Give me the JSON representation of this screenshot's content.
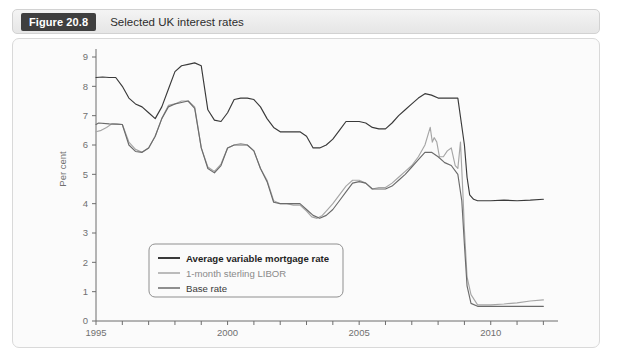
{
  "figure": {
    "badge": "Figure 20.8",
    "caption": "Selected UK interest rates"
  },
  "chart_data": {
    "type": "line",
    "title": "Selected UK interest rates",
    "xlabel": "",
    "ylabel": "Per cent",
    "xlim": [
      1995,
      2012.1
    ],
    "ylim": [
      0,
      9
    ],
    "yticks": [
      0,
      1,
      2,
      3,
      4,
      5,
      6,
      7,
      8,
      9
    ],
    "xticks": [
      1995,
      1996,
      1997,
      1998,
      1999,
      2000,
      2001,
      2002,
      2003,
      2004,
      2005,
      2006,
      2007,
      2008,
      2009,
      2010,
      2011,
      2012
    ],
    "xtick_labels_shown": [
      "1995",
      "2000",
      "2005",
      "2010"
    ],
    "grid": false,
    "legend_position": "lower-left-inside",
    "series": [
      {
        "name": "Average variable mortgage rate",
        "color": "#3a3a3a",
        "width": 1.15,
        "x": [
          1995.0,
          1995.25,
          1995.5,
          1995.75,
          1996.0,
          1996.25,
          1996.5,
          1996.75,
          1997.0,
          1997.25,
          1997.5,
          1997.75,
          1998.0,
          1998.25,
          1998.5,
          1998.75,
          1999.0,
          1999.25,
          1999.5,
          1999.75,
          2000.0,
          2000.25,
          2000.5,
          2000.75,
          2001.0,
          2001.25,
          2001.5,
          2001.75,
          2002.0,
          2002.25,
          2002.5,
          2002.75,
          2003.0,
          2003.25,
          2003.5,
          2003.75,
          2004.0,
          2004.25,
          2004.5,
          2004.75,
          2005.0,
          2005.25,
          2005.5,
          2005.75,
          2006.0,
          2006.25,
          2006.5,
          2006.75,
          2007.0,
          2007.25,
          2007.5,
          2007.75,
          2008.0,
          2008.25,
          2008.5,
          2008.75,
          2009.0,
          2009.1,
          2009.2,
          2009.35,
          2009.5,
          2010.0,
          2010.5,
          2011.0,
          2011.5,
          2012.0
        ],
        "y": [
          8.3,
          8.32,
          8.3,
          8.3,
          8.0,
          7.6,
          7.4,
          7.3,
          7.1,
          6.9,
          7.3,
          7.9,
          8.5,
          8.7,
          8.75,
          8.8,
          8.7,
          7.2,
          6.85,
          6.8,
          7.1,
          7.55,
          7.6,
          7.6,
          7.55,
          7.3,
          6.9,
          6.6,
          6.45,
          6.45,
          6.45,
          6.45,
          6.3,
          5.9,
          5.9,
          6.0,
          6.2,
          6.5,
          6.8,
          6.8,
          6.8,
          6.75,
          6.6,
          6.55,
          6.55,
          6.75,
          7.0,
          7.2,
          7.4,
          7.6,
          7.75,
          7.7,
          7.6,
          7.6,
          7.6,
          7.6,
          6.0,
          4.9,
          4.3,
          4.15,
          4.1,
          4.1,
          4.12,
          4.1,
          4.12,
          4.15
        ]
      },
      {
        "name": "1-month sterling LIBOR",
        "color": "#a6a6a6",
        "width": 1.15,
        "x": [
          1995.0,
          1995.2,
          1995.4,
          1995.6,
          1995.8,
          1996.0,
          1996.25,
          1996.5,
          1996.75,
          1997.0,
          1997.25,
          1997.5,
          1997.75,
          1998.0,
          1998.25,
          1998.5,
          1998.75,
          1999.0,
          1999.25,
          1999.5,
          1999.75,
          2000.0,
          2000.25,
          2000.5,
          2000.75,
          2001.0,
          2001.25,
          2001.5,
          2001.75,
          2002.0,
          2002.25,
          2002.5,
          2002.75,
          2003.0,
          2003.2,
          2003.4,
          2003.6,
          2003.8,
          2004.0,
          2004.25,
          2004.5,
          2004.75,
          2005.0,
          2005.25,
          2005.5,
          2005.75,
          2006.0,
          2006.25,
          2006.5,
          2006.75,
          2007.0,
          2007.25,
          2007.5,
          2007.7,
          2007.78,
          2007.85,
          2007.95,
          2008.05,
          2008.2,
          2008.35,
          2008.5,
          2008.65,
          2008.75,
          2008.85,
          2008.95,
          2009.0,
          2009.1,
          2009.25,
          2009.5,
          2010.0,
          2010.5,
          2011.0,
          2011.5,
          2012.0
        ],
        "y": [
          6.45,
          6.5,
          6.6,
          6.72,
          6.72,
          6.7,
          6.1,
          5.85,
          5.75,
          5.9,
          6.3,
          6.9,
          7.35,
          7.4,
          7.5,
          7.5,
          7.3,
          5.9,
          5.25,
          5.1,
          5.35,
          5.9,
          6.0,
          6.05,
          6.0,
          5.8,
          5.2,
          4.8,
          4.1,
          4.0,
          4.0,
          3.95,
          3.95,
          3.75,
          3.55,
          3.5,
          3.6,
          3.8,
          4.0,
          4.3,
          4.6,
          4.8,
          4.8,
          4.7,
          4.5,
          4.55,
          4.55,
          4.7,
          4.9,
          5.1,
          5.3,
          5.6,
          6.0,
          6.6,
          6.1,
          6.25,
          6.1,
          5.6,
          5.6,
          5.8,
          5.9,
          5.3,
          5.2,
          6.1,
          4.2,
          3.1,
          1.5,
          0.9,
          0.55,
          0.55,
          0.58,
          0.62,
          0.68,
          0.72
        ]
      },
      {
        "name": "Base rate",
        "color": "#6b6b6b",
        "width": 1.15,
        "x": [
          1995.0,
          1995.1,
          1995.5,
          1996.0,
          1996.25,
          1996.5,
          1996.75,
          1997.0,
          1997.25,
          1997.5,
          1997.75,
          1998.0,
          1998.25,
          1998.5,
          1998.75,
          1999.0,
          1999.25,
          1999.5,
          1999.75,
          2000.0,
          2000.25,
          2000.5,
          2000.75,
          2001.0,
          2001.25,
          2001.5,
          2001.75,
          2002.0,
          2002.5,
          2002.75,
          2003.0,
          2003.25,
          2003.5,
          2003.75,
          2004.0,
          2004.25,
          2004.5,
          2004.75,
          2005.0,
          2005.25,
          2005.5,
          2005.75,
          2006.0,
          2006.25,
          2006.5,
          2006.75,
          2007.0,
          2007.25,
          2007.5,
          2007.75,
          2008.0,
          2008.25,
          2008.5,
          2008.75,
          2008.9,
          2009.0,
          2009.1,
          2009.25,
          2009.5,
          2010.0,
          2010.5,
          2011.0,
          2011.5,
          2012.0
        ],
        "y": [
          6.7,
          6.75,
          6.72,
          6.7,
          6.0,
          5.78,
          5.75,
          5.9,
          6.3,
          6.9,
          7.3,
          7.4,
          7.45,
          7.5,
          7.25,
          5.9,
          5.2,
          5.05,
          5.3,
          5.9,
          6.0,
          6.0,
          6.0,
          5.8,
          5.2,
          4.75,
          4.05,
          4.0,
          4.0,
          4.0,
          3.8,
          3.6,
          3.5,
          3.6,
          3.8,
          4.1,
          4.4,
          4.7,
          4.75,
          4.7,
          4.5,
          4.5,
          4.5,
          4.6,
          4.8,
          5.0,
          5.25,
          5.5,
          5.75,
          5.75,
          5.6,
          5.4,
          5.3,
          5.0,
          4.1,
          2.6,
          1.2,
          0.6,
          0.5,
          0.5,
          0.5,
          0.5,
          0.5,
          0.5
        ]
      }
    ]
  },
  "axis": {
    "y_title": "Per cent",
    "y_labels": [
      "0",
      "1",
      "2",
      "3",
      "4",
      "5",
      "6",
      "7",
      "8",
      "9"
    ],
    "x_labels": [
      "1995",
      "2000",
      "2005",
      "2010"
    ]
  },
  "legend": {
    "items": [
      {
        "label": "Average variable mortgage rate",
        "color": "#3a3a3a"
      },
      {
        "label": "1-month sterling LIBOR",
        "color": "#a6a6a6"
      },
      {
        "label": "Base rate",
        "color": "#6b6b6b"
      }
    ]
  }
}
